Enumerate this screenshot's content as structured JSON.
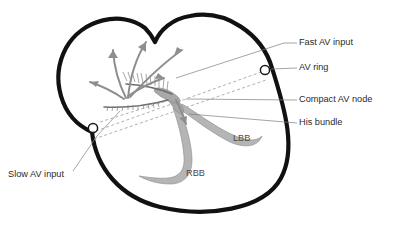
{
  "figure": {
    "type": "anatomical-diagram",
    "canvas": {
      "width": 400,
      "height": 225
    },
    "background_color": "#ffffff"
  },
  "colors": {
    "outline": "#111111",
    "conduction_tissue": "#b5b5b5",
    "arrow": "#8e8e8e",
    "dashed_guide": "#9a9a9a",
    "leader": "#7d7d7d",
    "label_text": "#2b2b2b",
    "inner_label_text": "#4a4a4a",
    "ring_fill": "#ffffff"
  },
  "callouts": [
    {
      "id": "fast-av-input",
      "label": "Fast AV input",
      "text_x": 299,
      "text_y": 43,
      "leader": "M 297 43 L 284 43 L 176 78"
    },
    {
      "id": "av-ring",
      "label": "AV ring",
      "text_x": 299,
      "text_y": 68,
      "leader": "M 297 68 L 272 69"
    },
    {
      "id": "compact-av-node",
      "label": "Compact AV node",
      "text_x": 299,
      "text_y": 100,
      "leader": "M 297 100 L 186 99"
    },
    {
      "id": "his-bundle",
      "label": "His bundle",
      "text_x": 299,
      "text_y": 123,
      "leader": "M 297 123 L 189 114"
    },
    {
      "id": "slow-av-input",
      "label": "Slow AV input",
      "text_x": 8,
      "text_y": 175,
      "leader": "M 72 172 L 98 135 L 121 110"
    }
  ],
  "inner_labels": [
    {
      "id": "lbb",
      "label": "LBB",
      "x": 233,
      "y": 139
    },
    {
      "id": "rbb",
      "label": "RBB",
      "x": 186,
      "y": 174
    }
  ],
  "av_rings": [
    {
      "id": "av-ring-right",
      "cx": 265,
      "cy": 70,
      "r": 4.6
    },
    {
      "id": "av-ring-left",
      "cx": 93,
      "cy": 128,
      "r": 4.6
    }
  ],
  "conduction_paths": {
    "his_bundle_note": "descends from compact node and bifurcates",
    "left_bundle_branch_note": "LBB sweeps right and down along septum",
    "right_bundle_branch_note": "RBB descends left and hooks at apex"
  },
  "atrial_activation_arrows": 5,
  "koch_triangle_lines": 2
}
